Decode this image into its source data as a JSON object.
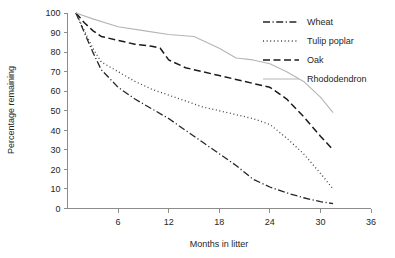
{
  "chart_data": {
    "type": "line",
    "title": "",
    "xlabel": "Months in litter",
    "ylabel": "Percentage remaining",
    "xlim": [
      0,
      36
    ],
    "ylim": [
      0,
      100
    ],
    "xticks": [
      6,
      12,
      18,
      24,
      30,
      36
    ],
    "yticks": [
      0,
      10,
      20,
      30,
      40,
      50,
      60,
      70,
      80,
      90,
      100
    ],
    "grid": false,
    "legend_position": "top-right",
    "series": [
      {
        "name": "Wheat",
        "style": "dash-dot",
        "color": "#262626",
        "x": [
          1,
          2,
          3,
          4,
          6,
          8,
          10,
          12,
          14,
          16,
          18,
          20,
          22,
          24,
          26,
          28,
          30,
          31.5
        ],
        "y": [
          100,
          90,
          80,
          71,
          62,
          56,
          51,
          46,
          40,
          34,
          28,
          22,
          15,
          11,
          8,
          5.5,
          3.5,
          2.5
        ]
      },
      {
        "name": "Tulip poplar",
        "style": "dotted",
        "color": "#404040",
        "x": [
          1,
          2,
          3,
          4,
          6,
          8,
          10,
          12,
          14,
          16,
          18,
          20,
          22,
          24,
          26,
          28,
          30,
          31.5
        ],
        "y": [
          100,
          91,
          82,
          75,
          70,
          65,
          61,
          58,
          55,
          52,
          50,
          48,
          46,
          43,
          36,
          28,
          18,
          10
        ]
      },
      {
        "name": "Oak",
        "style": "dashed",
        "color": "#1a1a1a",
        "x": [
          1,
          2,
          3,
          4,
          6,
          8,
          10,
          11,
          12,
          14,
          16,
          18,
          20,
          22,
          24,
          26,
          28,
          30,
          31.5
        ],
        "y": [
          100,
          95,
          91,
          88,
          86,
          84,
          83,
          82,
          76,
          72,
          70,
          68,
          66,
          64,
          62,
          56,
          47,
          37,
          30
        ]
      },
      {
        "name": "Rhododendron",
        "style": "solid",
        "color": "#b5b5b5",
        "x": [
          1,
          3,
          6,
          9,
          12,
          15,
          18,
          20,
          22,
          24,
          26,
          28,
          30,
          31.5
        ],
        "y": [
          100,
          97,
          93,
          91,
          89,
          88,
          82,
          77,
          76,
          74,
          70,
          65,
          57,
          49
        ]
      }
    ]
  },
  "legend": {
    "items": [
      {
        "label": "Wheat"
      },
      {
        "label": "Tulip poplar"
      },
      {
        "label": "Oak"
      },
      {
        "label": "Rhododendron"
      }
    ]
  },
  "axes": {
    "x_label": "Months in litter",
    "y_label": "Percentage remaining",
    "x_tick_labels": [
      "6",
      "12",
      "18",
      "24",
      "30",
      "36"
    ],
    "y_tick_labels": [
      "100",
      "90",
      "80",
      "70",
      "60",
      "50",
      "40",
      "30",
      "20",
      "10",
      "0"
    ]
  }
}
